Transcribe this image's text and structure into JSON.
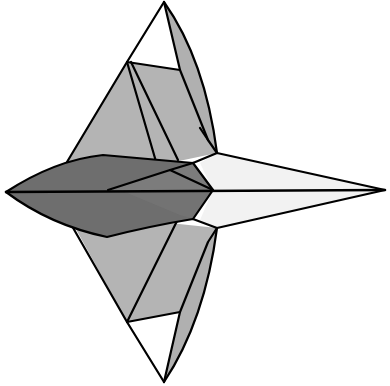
{
  "figure": {
    "title": "Origami-style star / dart fold diagram",
    "description": "Four-pointed folded paper figure with dark lens-shaped body pointing left, light gray side flaps top and bottom, and a white pointed tail to the right.",
    "colors": {
      "background": "#ffffff",
      "outline": "#000000",
      "light_gray_flap": "#b4b4b4",
      "mid_gray_flap": "#a6a6a6",
      "dark_body": "#6e6e6e",
      "dark_body_inner": "#7c7c7c",
      "white_tail": "#f2f2f2",
      "white_triangle": "#ffffff"
    },
    "points": {
      "top_tip": [
        164,
        2
      ],
      "bottom_tip": [
        164,
        382
      ],
      "left_tip": [
        6,
        192
      ],
      "right_tip": [
        385,
        190
      ],
      "center": [
        213,
        190
      ]
    },
    "regions": [
      {
        "name": "top-flap",
        "label": "upper side flap"
      },
      {
        "name": "bottom-flap",
        "label": "lower side flap"
      },
      {
        "name": "body-lens",
        "label": "dark central body"
      },
      {
        "name": "tail",
        "label": "white pointed tail"
      },
      {
        "name": "top-white-triangle",
        "label": "upper white triangle"
      },
      {
        "name": "bottom-white-triangle",
        "label": "lower white triangle"
      }
    ]
  }
}
